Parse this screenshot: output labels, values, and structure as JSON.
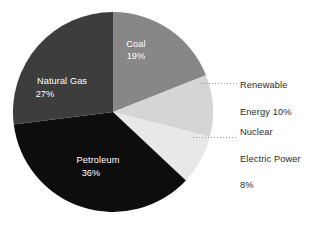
{
  "chart_data": {
    "type": "pie",
    "title": "",
    "subtitle": "",
    "xlabel": "",
    "ylabel": "",
    "legend_position": "none",
    "grid": false,
    "units": "percent",
    "total": 100,
    "start_angle_deg": 0,
    "direction": "clockwise",
    "categories": [
      "Coal",
      "Renewable Energy",
      "Nuclear Electric Power",
      "Petroleum",
      "Natural Gas"
    ],
    "values": [
      19,
      10,
      8,
      36,
      27
    ],
    "colors": [
      "#878787",
      "#d5d5d5",
      "#e8e8e8",
      "#0d0d0d",
      "#3d3d3d"
    ],
    "slices": [
      {
        "name": "Coal",
        "label": "Coal",
        "value": 19,
        "value_text": "19%",
        "color": "#878787",
        "label_placement": "inside",
        "label_color": "#ffffff",
        "label_x": 136,
        "label_y": 47,
        "value_x": 136,
        "value_y": 59
      },
      {
        "name": "Renewable Energy",
        "label": "Renewable",
        "value": 10,
        "value_text": "Energy 10%",
        "color": "#d5d5d5",
        "label_placement": "callout-right",
        "label_color": "#2b2b2b",
        "callout_text": "Renewable\nEnergy 10%"
      },
      {
        "name": "Nuclear Electric Power",
        "label": "Nuclear Electric Power",
        "value": 8,
        "value_text": "8%",
        "color": "#e8e8e8",
        "label_placement": "callout-right",
        "label_color": "#2b2b2b",
        "callout_text": "Nuclear\nElectric Power\n8%"
      },
      {
        "name": "Petroleum",
        "label": "Petroleum",
        "value": 36,
        "value_text": "36%",
        "color": "#0d0d0d",
        "label_placement": "inside",
        "label_color": "#ffffff",
        "label_x": 98,
        "label_y": 163,
        "value_x": 98,
        "value_y": 176
      },
      {
        "name": "Natural Gas",
        "label": "Natural Gas",
        "value": 27,
        "value_text": "27%",
        "color": "#3d3d3d",
        "label_placement": "inside",
        "label_color": "#ffffff",
        "label_x": 62,
        "label_y": 84,
        "value_x": 62,
        "value_y": 97
      }
    ],
    "geometry": {
      "center_x": 113,
      "center_y": 112,
      "radius": 100
    },
    "background_color": "#ffffff"
  },
  "callouts": {
    "renewable": {
      "line1": "Renewable",
      "line2": "Energy 10%"
    },
    "nuclear": {
      "line1": "Nuclear",
      "line2": "Electric Power",
      "line3": "8%"
    }
  },
  "slice_labels": {
    "coal_name": "Coal",
    "coal_value": "19%",
    "natural_gas_name": "Natural Gas",
    "natural_gas_value": "27%",
    "petroleum_name": "Petroleum",
    "petroleum_value": "36%"
  }
}
